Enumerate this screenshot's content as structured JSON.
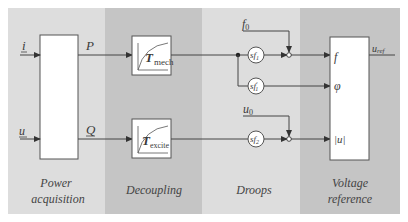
{
  "colors": {
    "band_light": "#dcdcdc",
    "band_dark": "#c4c4c4",
    "line": "#444444",
    "box_fill": "#ffffff"
  },
  "bands": [
    {
      "id": "power",
      "label_line1": "Power",
      "label_line2": "acquisition"
    },
    {
      "id": "decoupling",
      "label_line1": "Decoupling"
    },
    {
      "id": "droops",
      "label_line1": "Droops"
    },
    {
      "id": "voltage",
      "label_line1": "Voltage",
      "label_line2": "reference"
    }
  ],
  "signals": {
    "input_current": "i",
    "input_voltage": "u",
    "active_power": "P",
    "reactive_power": "Q",
    "f0": "f",
    "f0_sub": "0",
    "u0": "u",
    "u0_sub": "0",
    "out_f": "f",
    "out_phi": "φ",
    "out_u": "|u|",
    "uref": "u",
    "uref_sub": "ref"
  },
  "blocks": {
    "tmech": {
      "T": "T",
      "sub": "mech"
    },
    "texcite": {
      "T": "T",
      "sub": "excite"
    },
    "sf1": {
      "s": "s",
      "f": "f",
      "sub": "1"
    },
    "sf1p": {
      "s": "s",
      "f": "f",
      "sup": "′",
      "sub": "1"
    },
    "sf2": {
      "s": "s",
      "f": "f",
      "sub": "2"
    }
  }
}
